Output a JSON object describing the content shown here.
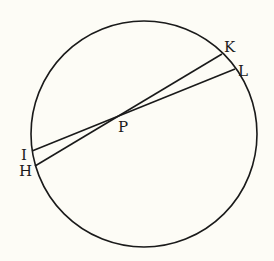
{
  "diagram": {
    "circle": {
      "label": "circle"
    },
    "points": {
      "K": {
        "label": "K"
      },
      "L": {
        "label": "L"
      },
      "I": {
        "label": "I"
      },
      "H": {
        "label": "H"
      },
      "P": {
        "label": "P"
      }
    },
    "chords": [
      {
        "name": "HK",
        "from": "H",
        "to": "K"
      },
      {
        "name": "IL",
        "from": "I",
        "to": "L"
      }
    ],
    "colors": {
      "stroke": "#1a1a1a",
      "background": "#fdfcf6"
    }
  }
}
